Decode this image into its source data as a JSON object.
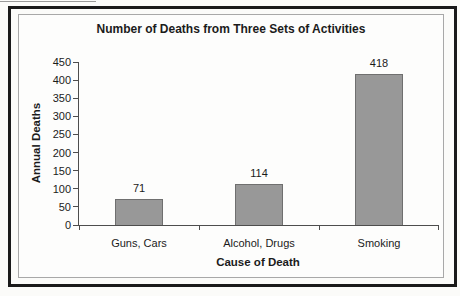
{
  "chart_data": {
    "type": "bar",
    "title": "Number of Deaths from Three Sets of Activities",
    "xlabel": "Cause of Death",
    "ylabel": "Annual Deaths",
    "categories": [
      "Guns, Cars",
      "Alcohol, Drugs",
      "Smoking"
    ],
    "values": [
      71,
      114,
      418
    ],
    "data_labels_shown": true,
    "ylim": [
      0,
      450
    ],
    "ytick_step": 50,
    "grid": false,
    "legend": false
  },
  "colors": {
    "bar_fill": "#989898",
    "bar_border": "#6f6f6f",
    "axis": "#4d4d4d",
    "text": "#1b1b1b",
    "outer_frame": "#1a1a1a",
    "inner_frame": "#a8a8a8",
    "background": "#fbfbf9"
  }
}
